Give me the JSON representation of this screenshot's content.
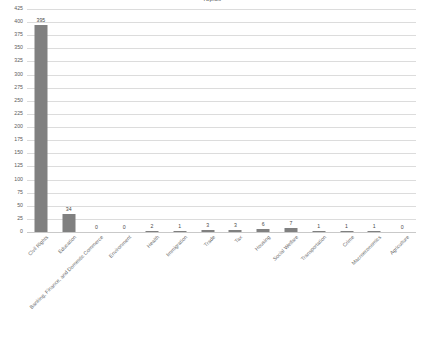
{
  "chart_data": {
    "type": "bar",
    "title": "Topics",
    "xlabel": "",
    "ylabel": "",
    "ylim": [
      0,
      425
    ],
    "ytick_step": 25,
    "yticks": [
      0,
      25,
      50,
      75,
      100,
      125,
      150,
      175,
      200,
      225,
      250,
      275,
      300,
      325,
      350,
      375,
      400,
      425
    ],
    "grid": true,
    "legend": "none",
    "bar_color": "#808080",
    "gridline_color": "#dcdcdc",
    "label_color": "#5a5a5a",
    "categories": [
      "Civil Rights",
      "Education",
      "Banking, Finance, and Domestic Commerce",
      "Environment",
      "Health",
      "Immigration",
      "Trade",
      "Tax",
      "Housing",
      "Social Welfare",
      "Transportation",
      "Crime",
      "Macroeconomics",
      "Agriculture"
    ],
    "values": [
      395,
      34,
      0,
      0,
      2,
      1,
      3,
      3,
      6,
      7,
      1,
      1,
      1,
      0
    ],
    "value_labels": [
      "395",
      "34",
      "0",
      "0",
      "2",
      "1",
      "3",
      "3",
      "6",
      "7",
      "1",
      "1",
      "1",
      "0"
    ]
  }
}
